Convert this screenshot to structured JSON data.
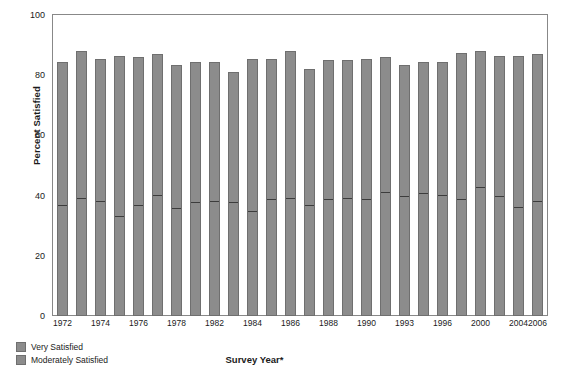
{
  "chart_data": {
    "type": "bar",
    "subtype": "stacked-vertical",
    "title": "",
    "xlabel": "Survey Year*",
    "ylabel": "Percent Satisfied",
    "ylim": [
      0,
      100
    ],
    "yticks": [
      0,
      20,
      40,
      60,
      80,
      100
    ],
    "grid": false,
    "legend_position": "bottom-left",
    "categories": [
      "1972",
      "1973",
      "1974",
      "1975",
      "1976",
      "1977",
      "1978",
      "1980",
      "1982",
      "1983",
      "1984",
      "1985",
      "1986",
      "1987",
      "1988",
      "1989",
      "1990",
      "1991",
      "1993",
      "1994",
      "1996",
      "1998",
      "2000",
      "2002",
      "2004",
      "2006"
    ],
    "tick_labels": [
      "1972",
      "1974",
      "1976",
      "1978",
      "1982",
      "1984",
      "1986",
      "1988",
      "1990",
      "1993",
      "1996",
      "2000",
      "2004",
      "2006"
    ],
    "series": [
      {
        "name": "Very Satisfied",
        "color": "#8c8c8c",
        "values": [
          36.5,
          39.0,
          38.0,
          33.0,
          36.5,
          40.0,
          35.5,
          37.5,
          38.0,
          37.5,
          34.5,
          38.5,
          39.0,
          36.5,
          38.5,
          39.0,
          38.5,
          41.0,
          39.5,
          40.5,
          40.0,
          38.5,
          42.5,
          39.5,
          36.0,
          38.0
        ]
      },
      {
        "name": "Moderately Satisfied",
        "color": "#8c8c8c",
        "values": [
          48.0,
          49.0,
          47.5,
          53.5,
          49.5,
          47.0,
          48.0,
          46.0,
          46.5,
          43.5,
          51.0,
          47.0,
          49.0,
          45.5,
          46.5,
          46.0,
          47.0,
          45.0,
          44.0,
          44.0,
          44.5,
          49.0,
          45.5,
          47.0,
          50.5,
          49.0
        ]
      }
    ],
    "totals": [
      84.5,
      88.0,
      85.5,
      86.5,
      86.0,
      87.0,
      83.5,
      84.5,
      84.5,
      81.0,
      85.5,
      85.5,
      88.0,
      82.0,
      85.0,
      85.0,
      85.5,
      86.0,
      83.5,
      84.5,
      84.5,
      87.5,
      88.0,
      86.5,
      86.5,
      87.0
    ]
  },
  "axes": {
    "y_title": "Percent Satisfied",
    "x_title": "Survey Year*",
    "y_tick_labels": [
      "0",
      "20",
      "40",
      "60",
      "80",
      "100"
    ]
  },
  "legend": {
    "items": [
      {
        "label": "Very Satisfied",
        "color": "#8c8c8c"
      },
      {
        "label": "Moderately Satisfied",
        "color": "#8c8c8c"
      }
    ]
  }
}
